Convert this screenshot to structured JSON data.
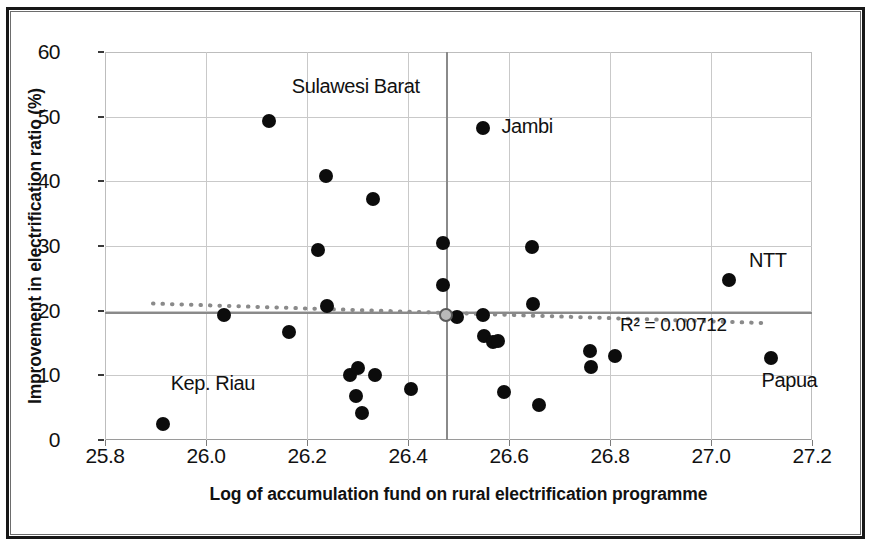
{
  "chart_data": {
    "type": "scatter",
    "title": "",
    "xlabel": "Log of accumulation fund on rural electrification programme",
    "ylabel": "Improvement in electrification ratio (%)",
    "xlim": [
      25.8,
      27.2
    ],
    "ylim": [
      0,
      60
    ],
    "xticks": [
      "25.8",
      "26.0",
      "26.2",
      "26.4",
      "26.6",
      "26.8",
      "27.0",
      "27.2"
    ],
    "xtick_values": [
      25.8,
      26.0,
      26.2,
      26.4,
      26.6,
      26.8,
      27.0,
      27.2
    ],
    "yticks": [
      "0",
      "10",
      "20",
      "30",
      "40",
      "50",
      "60"
    ],
    "ytick_values": [
      0,
      10,
      20,
      30,
      40,
      50,
      60
    ],
    "grid": true,
    "legend": "none",
    "annotations": [
      {
        "text": "Sulawesi Barat",
        "x": 26.17,
        "y": 54.5
      },
      {
        "text": "Jambi",
        "x": 26.585,
        "y": 48.3
      },
      {
        "text": "NTT",
        "x": 27.075,
        "y": 27.6
      },
      {
        "text": "Kep. Riau",
        "x": 25.93,
        "y": 8.5
      },
      {
        "text": "Papua",
        "x": 27.1,
        "y": 9.0
      }
    ],
    "trendline": {
      "style": "dotted",
      "color": "#8a8a8a",
      "r2_text": "R² = 0.00712",
      "r2_value": 0.00712,
      "x_start": 25.895,
      "y_start": 21.1,
      "x_end": 27.1,
      "y_end": 18.1
    },
    "reference_lines": {
      "vertical_x": 26.476,
      "horizontal_y": 19.8,
      "mean_marker": {
        "x": 26.476,
        "y": 19.4
      }
    },
    "points": [
      {
        "x": 25.915,
        "y": 2.4
      },
      {
        "x": 26.035,
        "y": 19.4
      },
      {
        "x": 26.125,
        "y": 49.3
      },
      {
        "x": 26.165,
        "y": 16.7
      },
      {
        "x": 26.222,
        "y": 29.4
      },
      {
        "x": 26.238,
        "y": 40.8
      },
      {
        "x": 26.24,
        "y": 20.7
      },
      {
        "x": 26.285,
        "y": 10.1
      },
      {
        "x": 26.3,
        "y": 11.2
      },
      {
        "x": 26.297,
        "y": 6.8
      },
      {
        "x": 26.308,
        "y": 4.2
      },
      {
        "x": 26.33,
        "y": 37.2
      },
      {
        "x": 26.335,
        "y": 10.0
      },
      {
        "x": 26.405,
        "y": 7.9
      },
      {
        "x": 26.47,
        "y": 30.4
      },
      {
        "x": 26.47,
        "y": 23.9
      },
      {
        "x": 26.498,
        "y": 19.0
      },
      {
        "x": 26.548,
        "y": 48.3
      },
      {
        "x": 26.548,
        "y": 19.4
      },
      {
        "x": 26.55,
        "y": 16.1
      },
      {
        "x": 26.568,
        "y": 15.2
      },
      {
        "x": 26.578,
        "y": 15.3
      },
      {
        "x": 26.59,
        "y": 7.5
      },
      {
        "x": 26.645,
        "y": 29.9
      },
      {
        "x": 26.648,
        "y": 21.0
      },
      {
        "x": 26.66,
        "y": 5.4
      },
      {
        "x": 26.76,
        "y": 13.8
      },
      {
        "x": 26.762,
        "y": 11.3
      },
      {
        "x": 26.81,
        "y": 13.0
      },
      {
        "x": 27.035,
        "y": 24.7
      },
      {
        "x": 27.118,
        "y": 12.7
      }
    ]
  },
  "figure": {
    "dot_color": "#0c0c0c",
    "grid_color": "#c9c9c9",
    "reference_line_color": "#8a8a8a",
    "axis_text_color": "#111111"
  }
}
